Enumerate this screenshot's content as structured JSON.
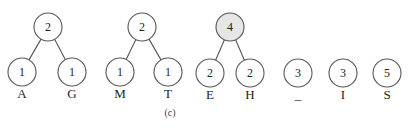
{
  "caption": "(c)",
  "colors": {
    "stroke": "#555555",
    "shaded_fill": "#e6e6e6"
  },
  "trees": [
    {
      "root": {
        "value": "2",
        "x": 48,
        "y": 27,
        "shaded": false
      },
      "leaves": [
        {
          "value": "1",
          "label": "A",
          "x": 22,
          "y": 72
        },
        {
          "value": "1",
          "label": "G",
          "x": 72,
          "y": 72
        }
      ]
    },
    {
      "root": {
        "value": "2",
        "x": 142,
        "y": 27,
        "shaded": false
      },
      "leaves": [
        {
          "value": "1",
          "label": "M",
          "x": 120,
          "y": 72
        },
        {
          "value": "1",
          "label": "T",
          "x": 168,
          "y": 72
        }
      ]
    },
    {
      "root": {
        "value": "4",
        "x": 230,
        "y": 27,
        "shaded": true
      },
      "leaves": [
        {
          "value": "2",
          "label": "E",
          "x": 210,
          "y": 73
        },
        {
          "value": "2",
          "label": "H",
          "x": 250,
          "y": 73
        }
      ]
    }
  ],
  "singletons": [
    {
      "value": "3",
      "label": "_",
      "x": 298,
      "y": 73
    },
    {
      "value": "3",
      "label": "I",
      "x": 343,
      "y": 73
    },
    {
      "value": "5",
      "label": "S",
      "x": 387,
      "y": 73
    }
  ]
}
